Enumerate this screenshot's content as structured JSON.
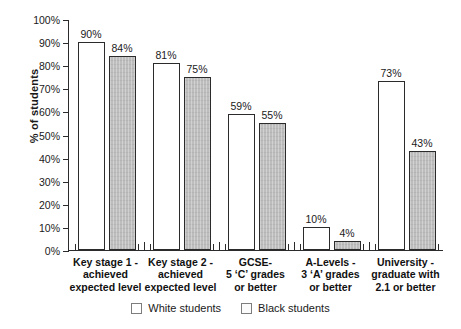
{
  "chart_data": {
    "type": "bar",
    "title": "",
    "xlabel": "",
    "ylabel": "% of students",
    "ylim": [
      0,
      100
    ],
    "grid": false,
    "legend_position": "bottom",
    "categories": [
      "Key stage 1 -\nachieved\nexpected level",
      "Key stage 2 -\nachieved\nexpected level",
      "GCSE-\n5 ‘C’ grades\nor better",
      "A-Levels -\n3 ‘A’ grades\nor better",
      "University -\ngraduate with\n2.1 or better"
    ],
    "series": [
      {
        "name": "White students",
        "fill": "white",
        "values": [
          90,
          81,
          59,
          10,
          73
        ],
        "labels": [
          "90%",
          "81%",
          "59%",
          "10%",
          "73%"
        ]
      },
      {
        "name": "Black students",
        "fill": "grey",
        "values": [
          84,
          75,
          55,
          4,
          43
        ],
        "labels": [
          "84%",
          "75%",
          "55%",
          "4%",
          "43%"
        ]
      }
    ],
    "ytick_labels": [
      "0%",
      "10%",
      "20%",
      "30%",
      "40%",
      "50%",
      "60%",
      "70%",
      "80%",
      "90%",
      "100%"
    ],
    "ytick_values": [
      0,
      10,
      20,
      30,
      40,
      50,
      60,
      70,
      80,
      90,
      100
    ],
    "colors": {
      "white_bar": "#ffffff",
      "grey_bar": "#bdbdbd",
      "axis": "#2b2b2b",
      "text": "#1a1a1a"
    }
  },
  "legend": {
    "items": [
      {
        "label": "White students",
        "swatch": "white"
      },
      {
        "label": "Black students",
        "swatch": "grey"
      }
    ]
  }
}
